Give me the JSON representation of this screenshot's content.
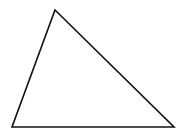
{
  "diagram": {
    "type": "triangle",
    "background": "#ffffff",
    "stroke": "#111111",
    "stroke_width": 1.6,
    "fill": "none",
    "vertices": {
      "top": [
        55,
        10
      ],
      "bottom_left": [
        12,
        127
      ],
      "bottom_right": [
        174,
        127
      ]
    },
    "labels": []
  }
}
